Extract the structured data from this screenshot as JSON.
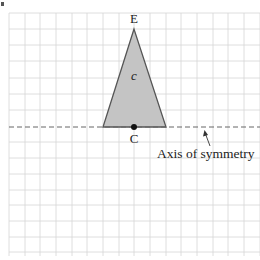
{
  "figure": {
    "marker": "a.",
    "grid": {
      "spacing": 15.7,
      "color": "#d4d4d4"
    },
    "triangle": {
      "fill": "#c4c4c4",
      "stroke": "#555555",
      "apex_label": "E",
      "base_point_label": "C",
      "interior_label": "c"
    },
    "axis": {
      "label": "Axis of symmetry",
      "style": "dashed",
      "color": "#666666"
    }
  }
}
